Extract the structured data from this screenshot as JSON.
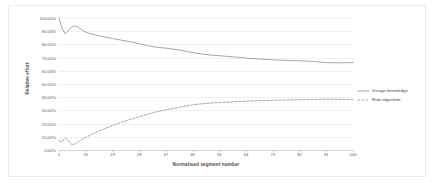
{
  "chart_data": {
    "type": "line",
    "title": "",
    "xlabel": "Normalised segment number",
    "ylabel": "Relative effort",
    "xlim": [
      1,
      100
    ],
    "ylim": [
      0,
      1
    ],
    "grid": true,
    "legend_position": "right",
    "x_ticks": [
      "1",
      "10",
      "19",
      "28",
      "37",
      "46",
      "55",
      "64",
      "73",
      "82",
      "91",
      "100"
    ],
    "y_ticks": [
      "0.00%",
      "10.00%",
      "20.00%",
      "30.00%",
      "40.00%",
      "50.00%",
      "60.00%",
      "70.00%",
      "80.00%",
      "90.00%",
      "100.00%"
    ],
    "x": [
      1,
      2,
      3,
      4,
      5,
      6,
      7,
      8,
      9,
      10,
      12,
      14,
      16,
      19,
      22,
      25,
      28,
      31,
      34,
      37,
      40,
      43,
      46,
      50,
      55,
      60,
      64,
      68,
      73,
      78,
      82,
      87,
      91,
      95,
      100
    ],
    "series": [
      {
        "name": "Design knowledge",
        "style": "solid",
        "color": "#808080",
        "values": [
          1.0,
          0.925,
          0.882,
          0.9,
          0.928,
          0.94,
          0.935,
          0.922,
          0.905,
          0.893,
          0.878,
          0.868,
          0.858,
          0.845,
          0.832,
          0.82,
          0.806,
          0.789,
          0.778,
          0.772,
          0.762,
          0.752,
          0.738,
          0.724,
          0.714,
          0.705,
          0.697,
          0.69,
          0.683,
          0.678,
          0.676,
          0.67,
          0.662,
          0.66,
          0.662
        ]
      },
      {
        "name": "Rule algorithm",
        "style": "dashed",
        "color": "#808080",
        "values": [
          0.07,
          0.062,
          0.09,
          0.075,
          0.045,
          0.04,
          0.055,
          0.07,
          0.082,
          0.095,
          0.118,
          0.14,
          0.158,
          0.185,
          0.21,
          0.232,
          0.252,
          0.272,
          0.29,
          0.305,
          0.318,
          0.33,
          0.342,
          0.352,
          0.36,
          0.365,
          0.37,
          0.373,
          0.376,
          0.379,
          0.381,
          0.383,
          0.385,
          0.384,
          0.383
        ]
      }
    ]
  },
  "legend": {
    "items": [
      {
        "label": "Design knowledge"
      },
      {
        "label": "Rule algorithm"
      }
    ]
  }
}
